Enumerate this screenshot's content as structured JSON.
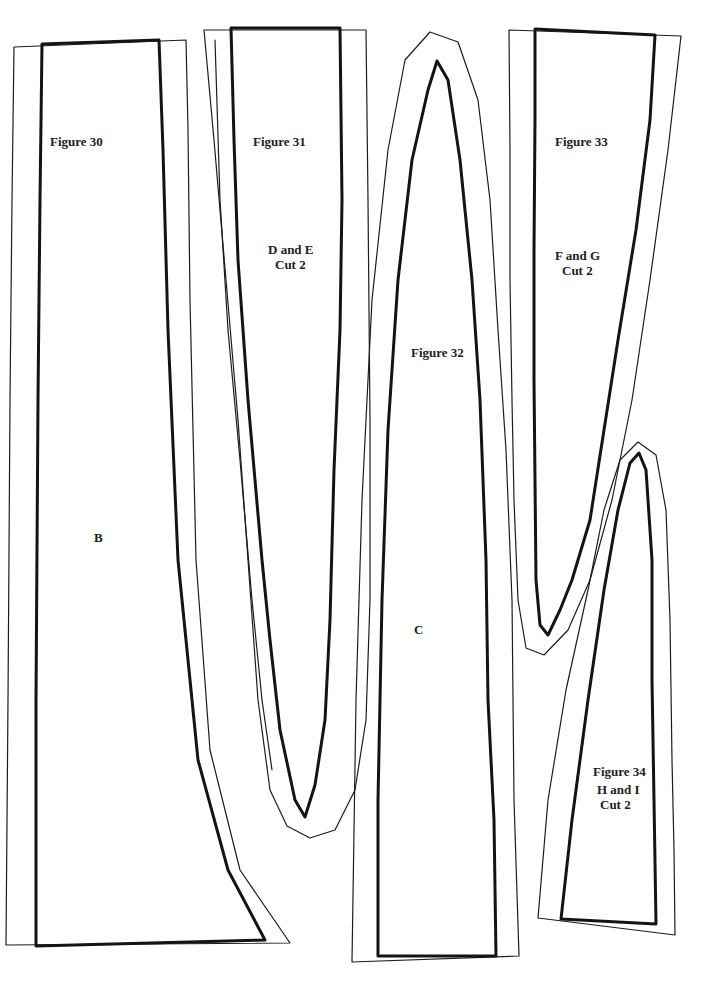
{
  "page": {
    "background": "#ffffff",
    "line_color": "#141414"
  },
  "pieces": [
    {
      "id": "fig30",
      "figure_label": "Figure 30",
      "piece_letter": "B"
    },
    {
      "id": "fig31",
      "figure_label": "Figure 31",
      "piece_name": "D and E",
      "cut": "Cut 2"
    },
    {
      "id": "fig32",
      "figure_label": "Figure 32",
      "piece_letter": "C"
    },
    {
      "id": "fig33",
      "figure_label": "Figure 33",
      "piece_name": "F and G",
      "cut": "Cut 2"
    },
    {
      "id": "fig34",
      "figure_label": "Figure 34",
      "piece_name": "H and I",
      "cut": "Cut 2"
    }
  ]
}
